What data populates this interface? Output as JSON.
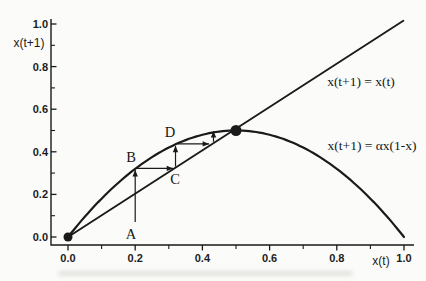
{
  "figure": {
    "background": "#fbfbf9",
    "ink": "#1a1a1a"
  },
  "chart_data": {
    "type": "line",
    "title": "",
    "xlabel": "x(t)",
    "ylabel": "x(t+1)",
    "xlim": [
      0,
      1
    ],
    "ylim": [
      0,
      1
    ],
    "grid": false,
    "x_ticks": [
      0,
      0.2,
      0.4,
      0.6,
      0.8,
      1
    ],
    "x_tick_labels": [
      "0.0",
      "0.2",
      "0.4",
      "0.6",
      "0.8",
      "1.0"
    ],
    "y_ticks": [
      0,
      0.2,
      0.4,
      0.6,
      0.8,
      1
    ],
    "y_tick_labels": [
      "0.0",
      "0.2",
      "0.4",
      "0.6",
      "0.8",
      "1.0"
    ],
    "minor_ticks_x": [
      0.1,
      0.3,
      0.5,
      0.7,
      0.9
    ],
    "minor_ticks_y": [
      0.1,
      0.3,
      0.5,
      0.7,
      0.9
    ],
    "series": [
      {
        "name": "identity-line",
        "label": "x(t+1) = x(t)",
        "type": "straight-line",
        "points": [
          [
            0,
            0
          ],
          [
            0.998,
            1.015
          ]
        ]
      },
      {
        "name": "logistic-curve",
        "label": "x(t+1) = αx(1-x)",
        "type": "function",
        "formula": "y = αx(1-x)",
        "alpha": 2,
        "domain": [
          0,
          1
        ]
      }
    ],
    "fixed_points": [
      {
        "x": 0,
        "y": 0,
        "r": 4.5
      },
      {
        "x": 0.5,
        "y": 0.5,
        "r": 5.5
      }
    ],
    "cobweb": {
      "x0": 0.2,
      "segments": [
        {
          "x1": 0.2,
          "y1": 0.07,
          "x2": 0.2,
          "y2": 0.315
        },
        {
          "x1": 0.205,
          "y1": 0.322,
          "x2": 0.313,
          "y2": 0.322
        },
        {
          "x1": 0.32,
          "y1": 0.33,
          "x2": 0.32,
          "y2": 0.428
        },
        {
          "x1": 0.326,
          "y1": 0.437,
          "x2": 0.42,
          "y2": 0.437
        },
        {
          "x1": 0.433,
          "y1": 0.447,
          "x2": 0.433,
          "y2": 0.497
        }
      ]
    },
    "annotations": [
      {
        "text": "x(t+1) = x(t)",
        "x": 0.872,
        "y": 0.728
      },
      {
        "text": "x(t+1) =  αx(1-x)",
        "x": 0.905,
        "y": 0.427
      }
    ],
    "point_labels": [
      {
        "text": "A",
        "x": 0.1875,
        "y": 0.014
      },
      {
        "text": "B",
        "x": 0.1875,
        "y": 0.376
      },
      {
        "text": "C",
        "x": 0.3185,
        "y": 0.272
      },
      {
        "text": "D",
        "x": 0.3036,
        "y": 0.493
      }
    ]
  }
}
